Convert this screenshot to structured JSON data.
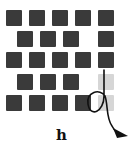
{
  "figure": {
    "panel_label": "h",
    "colors": {
      "dark_square": "#3a3a3a",
      "light_square": "#d6d6d6",
      "stroke": "#111111"
    },
    "grid": {
      "rows": [
        {
          "cells": [
            {
              "x": 6,
              "state": "dark"
            },
            {
              "x": 29,
              "state": "dark"
            },
            {
              "x": 52,
              "state": "dark"
            },
            {
              "x": 75,
              "state": "dark"
            },
            {
              "x": 98,
              "state": "dark"
            }
          ],
          "y": 10
        },
        {
          "cells": [
            {
              "x": 17,
              "state": "dark"
            },
            {
              "x": 40,
              "state": "dark"
            },
            {
              "x": 63,
              "state": "dark"
            },
            {
              "x": 98,
              "state": "dark"
            }
          ],
          "y": 31
        },
        {
          "cells": [
            {
              "x": 6,
              "state": "dark"
            },
            {
              "x": 29,
              "state": "dark"
            },
            {
              "x": 52,
              "state": "dark"
            },
            {
              "x": 75,
              "state": "dark"
            },
            {
              "x": 98,
              "state": "dark"
            }
          ],
          "y": 52
        },
        {
          "cells": [
            {
              "x": 17,
              "state": "dark"
            },
            {
              "x": 40,
              "state": "dark"
            },
            {
              "x": 63,
              "state": "dark"
            },
            {
              "x": 98,
              "state": "light"
            }
          ],
          "y": 74
        },
        {
          "cells": [
            {
              "x": 6,
              "state": "dark"
            },
            {
              "x": 29,
              "state": "dark"
            },
            {
              "x": 52,
              "state": "dark"
            },
            {
              "x": 75,
              "state": "dark"
            },
            {
              "x": 98,
              "state": "light"
            }
          ],
          "y": 95
        }
      ]
    },
    "annotation": "looped-arrow"
  }
}
